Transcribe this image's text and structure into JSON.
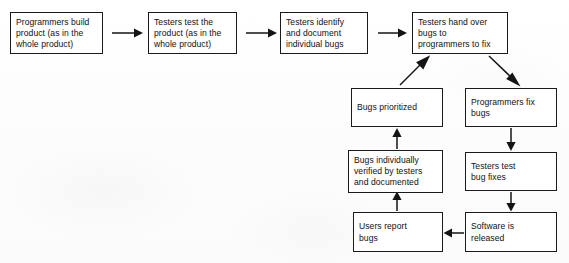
{
  "diagram": {
    "type": "flowchart",
    "background_color": "#fdfdfd",
    "line_color": "#141414",
    "box_fill": "#ffffff",
    "nodes": [
      {
        "id": "programmers-build",
        "label": "Programmers build\nproduct (as in the\nwhole product)",
        "x": 10,
        "y": 12,
        "w": 93,
        "h": 42
      },
      {
        "id": "testers-test-product",
        "label": "Testers test the\nproduct (as in the\nwhole product)",
        "x": 148,
        "y": 12,
        "w": 89,
        "h": 42
      },
      {
        "id": "testers-identify",
        "label": "Testers identify\nand document\nindividual bugs",
        "x": 280,
        "y": 12,
        "w": 88,
        "h": 42
      },
      {
        "id": "testers-hand-over",
        "label": "Testers hand over\nbugs to\nprogrammers to fix",
        "x": 412,
        "y": 12,
        "w": 96,
        "h": 42
      },
      {
        "id": "bugs-prioritized",
        "label": "Bugs prioritized",
        "x": 351,
        "y": 88,
        "w": 92,
        "h": 39
      },
      {
        "id": "programmers-fix",
        "label": "Programmers fix\nbugs",
        "x": 465,
        "y": 88,
        "w": 92,
        "h": 39
      },
      {
        "id": "bugs-verified",
        "label": "Bugs individually\nverified by testers\nand documented",
        "x": 348,
        "y": 150,
        "w": 95,
        "h": 43
      },
      {
        "id": "testers-test-fixes",
        "label": "Testers test\nbug fixes",
        "x": 465,
        "y": 152,
        "w": 92,
        "h": 39
      },
      {
        "id": "users-report",
        "label": "Users report\nbugs",
        "x": 353,
        "y": 212,
        "w": 90,
        "h": 40
      },
      {
        "id": "software-released",
        "label": "Software is\nreleased",
        "x": 465,
        "y": 212,
        "w": 92,
        "h": 40
      }
    ],
    "edges": [
      {
        "id": "edge-build-to-test",
        "from": "programmers-build",
        "to": "testers-test-product",
        "direction": "right"
      },
      {
        "id": "edge-test-to-identify",
        "from": "testers-test-product",
        "to": "testers-identify",
        "direction": "right"
      },
      {
        "id": "edge-identify-to-handover",
        "from": "testers-identify",
        "to": "testers-hand-over",
        "direction": "right"
      },
      {
        "id": "edge-handover-to-fix",
        "from": "testers-hand-over",
        "to": "programmers-fix",
        "direction": "down-right"
      },
      {
        "id": "edge-prioritized-to-handover",
        "from": "bugs-prioritized",
        "to": "testers-hand-over",
        "direction": "up-right"
      },
      {
        "id": "edge-fix-to-testfixes",
        "from": "programmers-fix",
        "to": "testers-test-fixes",
        "direction": "down"
      },
      {
        "id": "edge-testfixes-to-released",
        "from": "testers-test-fixes",
        "to": "software-released",
        "direction": "down"
      },
      {
        "id": "edge-released-to-users",
        "from": "software-released",
        "to": "users-report",
        "direction": "left"
      },
      {
        "id": "edge-users-to-verified",
        "from": "users-report",
        "to": "bugs-verified",
        "direction": "up"
      },
      {
        "id": "edge-verified-to-prioritized",
        "from": "bugs-verified",
        "to": "bugs-prioritized",
        "direction": "up"
      }
    ]
  }
}
